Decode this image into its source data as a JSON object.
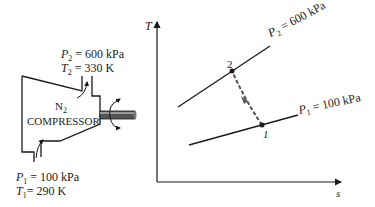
{
  "compressor": {
    "gas": "N",
    "gas_sub": "2",
    "name": "COMPRESSOR",
    "outlet": {
      "p_sym": "P",
      "p_sub": "2",
      "p_val": " = 600 kPa",
      "t_sym": "T",
      "t_sub": "2",
      "t_val": " = 330 K"
    },
    "inlet": {
      "p_sym": "P",
      "p_sub": "1",
      "p_val": " = 100 kPa",
      "t_sym": "T",
      "t_sub": "1",
      "t_val": "= 290 K"
    }
  },
  "ts_diagram": {
    "y_axis_label": "T",
    "x_axis_label": "s",
    "isobar_high": {
      "sym": "P",
      "sub": "2",
      "val": " = 600 kPa"
    },
    "isobar_low": {
      "sym": "P",
      "sub": "1",
      "val": " = 100 kPa"
    },
    "state_1": "1",
    "state_2": "2"
  },
  "colors": {
    "line": "#1a1a1a",
    "process": "#555555",
    "shaft": "#444444"
  }
}
